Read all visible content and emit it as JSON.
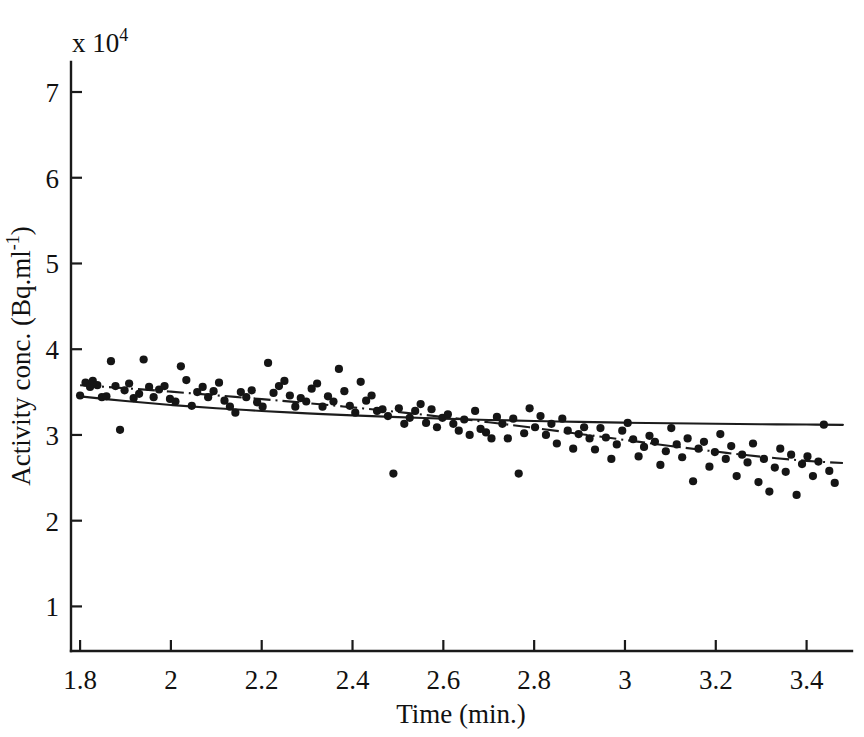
{
  "figure": {
    "background_color": "#ffffff",
    "ink_color": "#151515"
  },
  "chart_data": {
    "type": "scatter",
    "title": "",
    "subtitle": "",
    "xlabel": "Time (min.)",
    "ylabel": "Activity conc. (Bq.ml",
    "ylabel_superscript": "-1",
    "ylabel_suffix": ")",
    "y_multiplier_label": "x 10",
    "y_multiplier_exponent": "4",
    "xlim": [
      1.78,
      3.5
    ],
    "ylim": [
      0.48,
      7.35
    ],
    "grid": false,
    "legend": "none",
    "xticks": [
      1.8,
      2,
      2.2,
      2.4,
      2.6,
      2.8,
      3,
      3.2,
      3.4
    ],
    "xticklabels": [
      "1.8",
      "2",
      "2.2",
      "2.4",
      "2.6",
      "2.8",
      "3",
      "3.2",
      "3.4"
    ],
    "yticks": [
      1,
      2,
      3,
      4,
      5,
      6,
      7
    ],
    "yticklabels": [
      "1",
      "2",
      "3",
      "4",
      "5",
      "6",
      "7"
    ],
    "point_radius_px": 4.1,
    "series": [
      {
        "name": "measured activity concentration",
        "style": "points",
        "x": [
          1.8,
          1.812,
          1.822,
          1.828,
          1.838,
          1.848,
          1.858,
          1.868,
          1.878,
          1.888,
          1.898,
          1.908,
          1.918,
          1.93,
          1.94,
          1.952,
          1.962,
          1.974,
          1.986,
          1.998,
          2.01,
          2.022,
          2.034,
          2.046,
          2.058,
          2.07,
          2.082,
          2.094,
          2.106,
          2.118,
          2.13,
          2.142,
          2.154,
          2.166,
          2.178,
          2.19,
          2.202,
          2.214,
          2.226,
          2.238,
          2.25,
          2.262,
          2.274,
          2.286,
          2.298,
          2.31,
          2.322,
          2.334,
          2.346,
          2.358,
          2.37,
          2.382,
          2.394,
          2.406,
          2.418,
          2.43,
          2.442,
          2.454,
          2.466,
          2.478,
          2.49,
          2.502,
          2.514,
          2.526,
          2.538,
          2.55,
          2.562,
          2.574,
          2.586,
          2.598,
          2.61,
          2.622,
          2.634,
          2.646,
          2.658,
          2.67,
          2.682,
          2.694,
          2.706,
          2.718,
          2.73,
          2.742,
          2.754,
          2.766,
          2.778,
          2.79,
          2.802,
          2.814,
          2.826,
          2.838,
          2.85,
          2.862,
          2.874,
          2.886,
          2.898,
          2.91,
          2.922,
          2.934,
          2.946,
          2.958,
          2.97,
          2.982,
          2.994,
          3.006,
          3.018,
          3.03,
          3.042,
          3.054,
          3.066,
          3.078,
          3.09,
          3.102,
          3.114,
          3.126,
          3.138,
          3.15,
          3.162,
          3.174,
          3.186,
          3.198,
          3.21,
          3.222,
          3.234,
          3.246,
          3.258,
          3.27,
          3.282,
          3.294,
          3.306,
          3.318,
          3.33,
          3.342,
          3.354,
          3.366,
          3.378,
          3.39,
          3.402,
          3.414,
          3.426,
          3.438,
          3.45,
          3.462
        ],
        "y": [
          3.46,
          3.61,
          3.56,
          3.63,
          3.58,
          3.44,
          3.45,
          3.86,
          3.57,
          3.06,
          3.52,
          3.6,
          3.43,
          3.48,
          3.88,
          3.56,
          3.44,
          3.53,
          3.57,
          3.42,
          3.39,
          3.8,
          3.64,
          3.34,
          3.5,
          3.56,
          3.44,
          3.51,
          3.61,
          3.4,
          3.33,
          3.26,
          3.5,
          3.44,
          3.52,
          3.38,
          3.33,
          3.84,
          3.49,
          3.57,
          3.63,
          3.46,
          3.33,
          3.43,
          3.39,
          3.54,
          3.6,
          3.33,
          3.45,
          3.39,
          3.77,
          3.51,
          3.34,
          3.26,
          3.62,
          3.4,
          3.46,
          3.28,
          3.3,
          3.22,
          2.55,
          3.31,
          3.13,
          3.2,
          3.28,
          3.36,
          3.14,
          3.3,
          3.09,
          3.2,
          3.24,
          3.13,
          3.05,
          3.18,
          3.0,
          3.28,
          3.07,
          3.03,
          2.96,
          3.21,
          3.13,
          2.96,
          3.19,
          2.55,
          3.02,
          3.31,
          3.09,
          3.22,
          3.0,
          3.13,
          2.9,
          3.19,
          3.05,
          2.84,
          3.01,
          3.09,
          2.96,
          2.83,
          3.08,
          2.97,
          2.72,
          2.89,
          3.05,
          3.14,
          2.95,
          2.75,
          2.86,
          2.99,
          2.92,
          2.65,
          2.81,
          3.08,
          2.89,
          2.74,
          2.96,
          2.46,
          2.84,
          2.92,
          2.63,
          2.8,
          3.01,
          2.72,
          2.87,
          2.52,
          2.77,
          2.68,
          2.9,
          2.45,
          2.72,
          2.34,
          2.62,
          2.84,
          2.57,
          2.77,
          2.3,
          2.66,
          2.75,
          2.52,
          2.69,
          3.12,
          2.58,
          2.44
        ]
      },
      {
        "name": "fitted model (solid)",
        "style": "solid-line",
        "x": [
          1.8,
          1.9,
          2.0,
          2.1,
          2.2,
          2.3,
          2.4,
          2.5,
          2.6,
          2.7,
          2.8,
          2.9,
          3.0,
          3.1,
          3.2,
          3.3,
          3.4,
          3.48
        ],
        "y": [
          3.45,
          3.395,
          3.35,
          3.312,
          3.28,
          3.252,
          3.228,
          3.208,
          3.19,
          3.175,
          3.163,
          3.152,
          3.143,
          3.136,
          3.13,
          3.125,
          3.121,
          3.118
        ]
      },
      {
        "name": "fitted model (dash-dot)",
        "style": "dash-dot-line",
        "x": [
          1.8,
          1.9,
          2.0,
          2.1,
          2.2,
          2.3,
          2.4,
          2.5,
          2.6,
          2.7,
          2.8,
          2.9,
          3.0,
          3.1,
          3.2,
          3.3,
          3.4,
          3.48
        ],
        "y": [
          3.58,
          3.545,
          3.505,
          3.462,
          3.418,
          3.372,
          3.322,
          3.268,
          3.21,
          3.148,
          3.082,
          3.012,
          2.942,
          2.872,
          2.806,
          2.746,
          2.698,
          2.672
        ]
      }
    ]
  }
}
